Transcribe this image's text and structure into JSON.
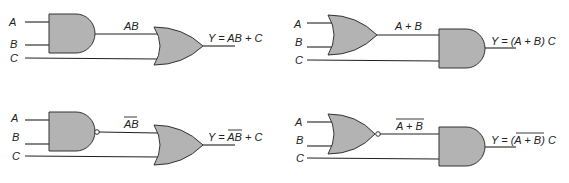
{
  "colors": {
    "gate_fill": "#b3b3b3",
    "stroke": "#333333",
    "background": "#ffffff"
  },
  "circuits": [
    {
      "id": "and-or",
      "inputs": [
        "A",
        "B",
        "C"
      ],
      "gate1": "AND",
      "gate2": "OR",
      "intermediate": "AB",
      "output": "Y = AB + C"
    },
    {
      "id": "or-and",
      "inputs": [
        "A",
        "B",
        "C"
      ],
      "gate1": "OR",
      "gate2": "AND",
      "intermediate": "A + B",
      "output": "Y = (A + B) C"
    },
    {
      "id": "nand-or",
      "inputs": [
        "A",
        "B",
        "C"
      ],
      "gate1": "NAND",
      "gate2": "OR",
      "intermediate": "AB",
      "intermediate_overbar": true,
      "output_prefix": "Y = ",
      "output_overbar_part": "AB",
      "output_suffix": " + C"
    },
    {
      "id": "nor-and",
      "inputs": [
        "A",
        "B",
        "C"
      ],
      "gate1": "NOR",
      "gate2": "AND",
      "intermediate": "A + B",
      "intermediate_overbar": true,
      "output_prefix": "Y = (",
      "output_overbar_part": "A + B",
      "output_suffix": ") C"
    }
  ]
}
